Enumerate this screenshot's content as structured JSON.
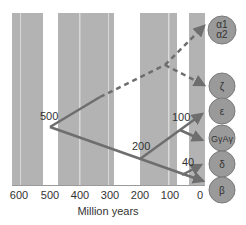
{
  "diagram": {
    "type": "gene-duplication-phylogeny",
    "axis": {
      "title": "Million years",
      "ticks": [
        "600",
        "500",
        "400",
        "300",
        "200",
        "100",
        "0"
      ]
    },
    "nodes": [
      {
        "label": "500",
        "time_mya": 500
      },
      {
        "label": "200",
        "time_mya": 200
      },
      {
        "label": "100",
        "time_mya": 100
      },
      {
        "label": "40",
        "time_mya": 40
      }
    ],
    "genes": [
      {
        "id": "alpha",
        "line1": "α1",
        "line2": "α2",
        "lineage": "dashed"
      },
      {
        "id": "zeta",
        "line1": "ζ",
        "lineage": "dashed"
      },
      {
        "id": "epsilon",
        "line1": "ε",
        "lineage": "solid"
      },
      {
        "id": "gamma",
        "line1": "GγAγ",
        "lineage": "solid"
      },
      {
        "id": "delta",
        "line1": "δ",
        "lineage": "solid"
      },
      {
        "id": "beta",
        "line1": "β",
        "lineage": "solid"
      }
    ],
    "colors": {
      "stripe_gray": "#b3b3b3",
      "background": "#ffffff",
      "branch": "#6e6e6e",
      "circle_fill": "#9a9a9a",
      "circle_stroke": "#7a7a7a",
      "text": "#333333"
    }
  }
}
